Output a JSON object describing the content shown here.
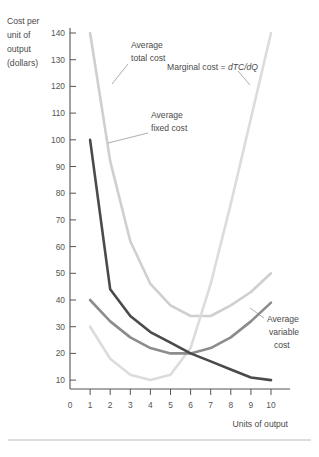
{
  "chart_data": {
    "type": "line",
    "title": "",
    "xlabel": "Units of output",
    "ylabel": "Cost per unit of output (dollars)",
    "ylabel_lines": [
      "Cost per",
      "unit of",
      "output",
      "(dollars)"
    ],
    "x": [
      1,
      2,
      3,
      4,
      5,
      6,
      7,
      8,
      9,
      10
    ],
    "xlim": [
      0,
      10
    ],
    "ylim": [
      0,
      145
    ],
    "xticks": [
      0,
      1,
      2,
      3,
      4,
      5,
      6,
      7,
      8,
      9,
      10
    ],
    "yticks": [
      10,
      20,
      30,
      40,
      50,
      60,
      70,
      80,
      90,
      100,
      110,
      120,
      130,
      140
    ],
    "grid": false,
    "legend": "inline-annotations",
    "series": [
      {
        "name": "Average total cost",
        "label": "Average total cost",
        "label_lines": [
          "Average",
          "total cost"
        ],
        "color": "#cfcfcf",
        "width": 2.6,
        "values": [
          140,
          92,
          62,
          46,
          38,
          34,
          34,
          38,
          43,
          50
        ]
      },
      {
        "name": "Average fixed cost",
        "label": "Average fixed cost",
        "label_lines": [
          "Average",
          "fixed cost"
        ],
        "color": "#4a4a4a",
        "width": 2.6,
        "values": [
          100,
          44,
          34,
          28,
          24,
          20,
          17,
          14,
          11,
          10
        ]
      },
      {
        "name": "Average variable cost",
        "label": "Average variable cost",
        "label_lines": [
          "Average",
          "variable",
          "cost"
        ],
        "color": "#8c8c8c",
        "width": 2.6,
        "values": [
          40,
          32,
          26,
          22,
          20,
          20,
          22,
          26,
          32,
          39
        ]
      },
      {
        "name": "Marginal cost",
        "label": "Marginal cost = dTC/dQ",
        "label_plain": "Marginal cost = ",
        "label_italic": "dTC/dQ",
        "color": "#dcdcdc",
        "width": 2.6,
        "values": [
          30,
          18,
          12,
          10,
          12,
          22,
          46,
          76,
          108,
          140
        ]
      }
    ]
  },
  "axes": {
    "y_label_lines": [
      "Cost per",
      "unit of",
      "output",
      "(dollars)"
    ],
    "x_label": "Units of output",
    "y_ticks": [
      "140",
      "130",
      "120",
      "110",
      "100",
      "90",
      "80",
      "70",
      "60",
      "50",
      "40",
      "30",
      "20",
      "10"
    ],
    "x_ticks": [
      "0",
      "1",
      "2",
      "3",
      "4",
      "5",
      "6",
      "7",
      "8",
      "9",
      "10"
    ]
  },
  "annotations": {
    "atc": {
      "line1": "Average",
      "line2": "total cost"
    },
    "afc": {
      "line1": "Average",
      "line2": "fixed cost"
    },
    "avc": {
      "line1": "Average",
      "line2": "variable",
      "line3": "cost"
    },
    "mc": {
      "plain": "Marginal cost = ",
      "italic": "dTC/dQ"
    }
  },
  "colors": {
    "atc": "#cfcfcf",
    "afc": "#4a4a4a",
    "avc": "#8c8c8c",
    "mc": "#dcdcdc",
    "axis": "#555555",
    "text": "#4a4a4a",
    "rule": "#bcbcbc",
    "background": "#ffffff"
  }
}
